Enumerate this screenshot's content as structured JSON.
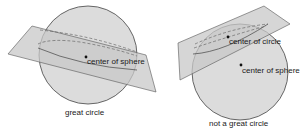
{
  "figure_left": {
    "label_center": "center of sphere",
    "caption": "great circle"
  },
  "figure_right": {
    "label_circle_center": "center of circle",
    "label_sphere_center": "center of sphere",
    "caption": "not a great circle"
  },
  "colors": {
    "sphere_fill": "#dcdcdc",
    "plane_fill": "#c8c8c8",
    "stroke": "#444444"
  }
}
